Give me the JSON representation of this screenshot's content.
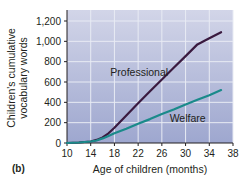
{
  "chart_data": {
    "type": "line",
    "title": "",
    "panel_label": "(b)",
    "xlabel": "Age of children (months)",
    "ylabel_line1": "Children's cumulative",
    "ylabel_line2": "vocabulary words",
    "xlim": [
      10,
      38
    ],
    "ylim": [
      0,
      1200
    ],
    "x_ticks": [
      10,
      14,
      18,
      22,
      26,
      30,
      34,
      38
    ],
    "y_ticks": [
      0,
      200,
      400,
      600,
      800,
      1000,
      1200
    ],
    "y_tick_labels": [
      "0",
      "200",
      "400",
      "600",
      "800",
      "1,000",
      "1,200"
    ],
    "grid": true,
    "legend_position": "inline labels",
    "series": [
      {
        "name": "Professional",
        "color": "#3a1a3f",
        "x": [
          10,
          12,
          14,
          15,
          16,
          17,
          18,
          20,
          22,
          24,
          26,
          28,
          30,
          32,
          34,
          36
        ],
        "y": [
          0,
          5,
          15,
          30,
          55,
          95,
          150,
          270,
          390,
          510,
          625,
          740,
          855,
          970,
          1030,
          1090
        ]
      },
      {
        "name": "Welfare",
        "color": "#1a8a8a",
        "x": [
          10,
          12,
          14,
          15,
          16,
          17,
          18,
          20,
          22,
          24,
          26,
          28,
          30,
          32,
          34,
          36
        ],
        "y": [
          0,
          5,
          15,
          25,
          45,
          70,
          95,
          140,
          190,
          235,
          285,
          330,
          380,
          425,
          470,
          520
        ]
      }
    ],
    "annotations": [
      {
        "text": "Professional",
        "x": 19,
        "y": 700
      },
      {
        "text": "Welfare",
        "x": 29,
        "y": 250
      }
    ]
  },
  "colors": {
    "plot_background": "#a9b1d3",
    "plot_background_top": "#c9cde3",
    "grid": "#e8ebf4",
    "axis": "#231f20"
  }
}
